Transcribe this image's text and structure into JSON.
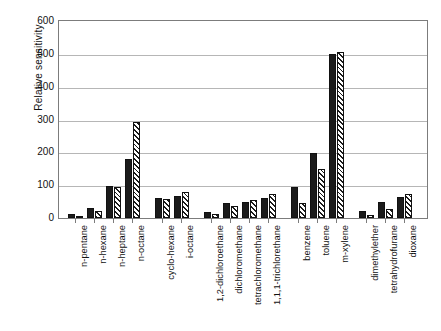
{
  "chart_data": {
    "type": "bar",
    "title": "",
    "subtitle": "",
    "xlabel": "",
    "ylabel": "Relative sensitivity",
    "ylim": [
      0,
      600
    ],
    "yticks": [
      0,
      100,
      200,
      300,
      400,
      500,
      600
    ],
    "ytick_labels": [
      "0",
      "100",
      "200",
      "300",
      "400",
      "500",
      "600"
    ],
    "grid": "horizontal",
    "legend": "none",
    "bar_styles": [
      "solid-black",
      "diagonal-hatch"
    ],
    "groups": [
      {
        "name": "alkanes",
        "categories": [
          "n-pentane",
          "n-hexane",
          "n-heptane",
          "n-octane"
        ]
      },
      {
        "name": "cyclic-branched-alkanes",
        "categories": [
          "cyclo-hexane",
          "i-octane"
        ]
      },
      {
        "name": "chlorinated",
        "categories": [
          "1,2-dichloroethane",
          "dichloromethane",
          "tetrachloromethane",
          "1,1,1-trichlorethane"
        ]
      },
      {
        "name": "aromatics",
        "categories": [
          "benzene",
          "toluene",
          "m-xylene"
        ]
      },
      {
        "name": "ethers",
        "categories": [
          "dimethylether",
          "tetrahydrofurane",
          "dioxane"
        ]
      }
    ],
    "categories": [
      "n-pentane",
      "n-hexane",
      "n-heptane",
      "n-octane",
      "cyclo-hexane",
      "i-octane",
      "1,2-dichloroethane",
      "dichloromethane",
      "tetrachloromethane",
      "1,1,1-trichlorethane",
      "benzene",
      "toluene",
      "m-xylene",
      "dimethylether",
      "tetrahydrofurane",
      "dioxane"
    ],
    "series": [
      {
        "name": "series-1",
        "style": "solid-black",
        "values": [
          12,
          30,
          96,
          180,
          62,
          68,
          18,
          45,
          48,
          62,
          93,
          197,
          500,
          20,
          50,
          65
        ]
      },
      {
        "name": "series-2",
        "style": "diagonal-hatch",
        "values": [
          7,
          22,
          95,
          292,
          58,
          80,
          12,
          38,
          55,
          72,
          47,
          148,
          505,
          8,
          28,
          72
        ]
      }
    ]
  },
  "axis": {
    "y_title": "Relative sensitivity"
  }
}
